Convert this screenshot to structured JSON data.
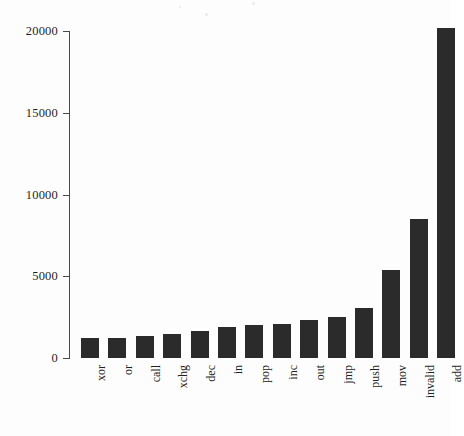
{
  "chart_data": {
    "type": "bar",
    "title": "",
    "subtitle": "",
    "xlabel": "",
    "ylabel": "",
    "categories": [
      "xor",
      "or",
      "call",
      "xchg",
      "dec",
      "in",
      "pop",
      "inc",
      "out",
      "jmp",
      "push",
      "mov",
      "invalid",
      "add"
    ],
    "values": [
      1200,
      1250,
      1350,
      1450,
      1650,
      1900,
      2000,
      2050,
      2330,
      2510,
      3050,
      5380,
      8500,
      20200
    ],
    "ylim": [
      0,
      20500
    ],
    "yticks": [
      0,
      5000,
      10000,
      15000,
      20000
    ],
    "ytick_labels": [
      "0",
      "5000",
      "10000",
      "15000",
      "20000"
    ],
    "xtick_labels": [
      "xor",
      "or",
      "call",
      "xchg",
      "dec",
      "in",
      "pop",
      "inc",
      "out",
      "jmp",
      "push",
      "mov",
      "invalid",
      "add"
    ],
    "grid": false,
    "legend": null,
    "legend_position": "none",
    "annotations": [],
    "bar_color": "#2b2b2b",
    "axis_color": "#4a4a4a",
    "background_color": "#fdfdfd",
    "x_label_rotation": 90,
    "series": [
      {
        "name": "count",
        "values": [
          1200,
          1250,
          1350,
          1450,
          1650,
          1900,
          2000,
          2050,
          2330,
          2510,
          3050,
          5380,
          8500,
          20200
        ]
      }
    ]
  }
}
